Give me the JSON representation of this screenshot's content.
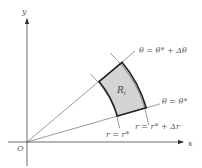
{
  "diagram": {
    "axes": {
      "x_label": "x",
      "y_label": "y",
      "origin_label": "O"
    },
    "region": {
      "label": "R",
      "subscript": "i",
      "fill_color": "#d4d4d4",
      "border_color": "#222222"
    },
    "rays": [
      {
        "label": "θ = θ* + Δθ",
        "angle_deg": 40
      },
      {
        "label": "θ = θ*",
        "angle_deg": 16
      }
    ],
    "arcs": [
      {
        "label": "r = r*",
        "radius": 94
      },
      {
        "label": "r = r* + Δr",
        "radius": 124
      }
    ],
    "colors": {
      "axis": "#444444",
      "ray": "#555555",
      "text": "#555555"
    }
  }
}
